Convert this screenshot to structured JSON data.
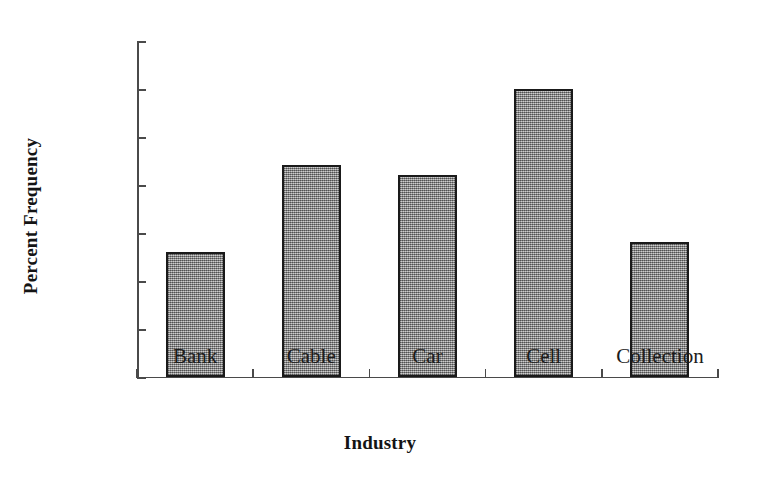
{
  "chart_data": {
    "type": "bar",
    "title": "",
    "xlabel": "Industry",
    "ylabel": "Percent Frequency",
    "categories": [
      "Bank",
      "Cable",
      "Car",
      "Cell",
      "Collection"
    ],
    "values": [
      13,
      22,
      21,
      30,
      14
    ],
    "value_labels": [
      "13%",
      "22%",
      "21%",
      "30%",
      "14%"
    ],
    "ylim": [
      0,
      35
    ],
    "ytick_values": [
      0,
      5,
      10,
      15,
      20,
      25,
      30,
      35
    ],
    "ytick_labels": [
      "0%",
      "5%",
      "10%",
      "15%",
      "20%",
      "25%",
      "30%",
      "35%"
    ],
    "grid": false,
    "legend": false,
    "legend_position": "none",
    "bar_fill_color": "#9d9d9d",
    "bar_edge_color": "#1a1a1a",
    "axis_color": "#4a4a4a",
    "background_color": "#ffffff"
  }
}
